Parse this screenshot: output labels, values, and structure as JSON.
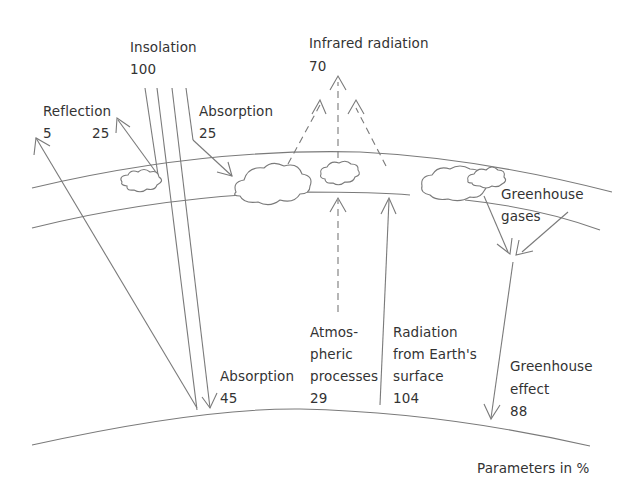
{
  "diagram": {
    "labels": {
      "insolation": {
        "name": "Insolation",
        "value": "100"
      },
      "infrared": {
        "name": "Infrared radiation",
        "value": "70"
      },
      "reflection": {
        "name": "Reflection",
        "value_left": "5",
        "value_right": "25"
      },
      "absorption_atm": {
        "name": "Absorption",
        "value": "25"
      },
      "greenhouse_gases": {
        "line1": "Greenhouse",
        "line2": "gases"
      },
      "absorption_surface": {
        "name": "Absorption",
        "value": "45"
      },
      "atmospheric": {
        "line1": "Atmos-",
        "line2": "pheric",
        "line3": "processes",
        "value": "29"
      },
      "radiation_surface": {
        "line1": "Radiation",
        "line2": "from Earth's",
        "line3": "surface",
        "value": "104"
      },
      "greenhouse_effect": {
        "line1": "Greenhouse",
        "line2": "effect",
        "value": "88"
      },
      "units_note": "Parameters in %"
    },
    "colors": {
      "line": "#7a7a7a",
      "text": "#333333",
      "background": "#ffffff"
    }
  }
}
